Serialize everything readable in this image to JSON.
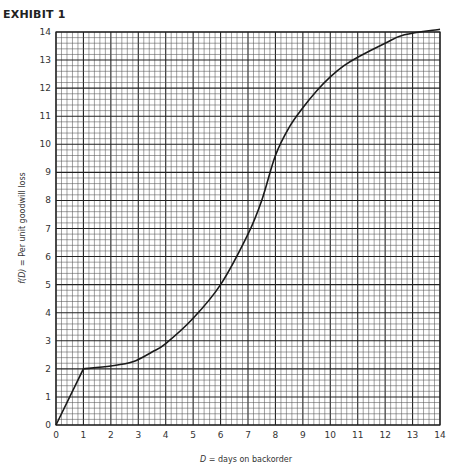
{
  "exhibit_title": "EXHIBIT 1",
  "chart_data": {
    "type": "line",
    "title": "EXHIBIT 1",
    "xlabel": "D = days on backorder",
    "ylabel": "f(D) = Per unit goodwill loss",
    "xlim": [
      0,
      14
    ],
    "ylim": [
      0,
      14
    ],
    "x_ticks": [
      0,
      1,
      2,
      3,
      4,
      5,
      6,
      7,
      8,
      9,
      10,
      11,
      12,
      13,
      14
    ],
    "y_ticks": [
      0,
      1,
      2,
      3,
      4,
      5,
      6,
      7,
      8,
      9,
      10,
      11,
      12,
      13,
      14
    ],
    "grid": true,
    "grid_minor_divisions": 5,
    "legend": null,
    "series": [
      {
        "name": "f(D)",
        "x": [
          0,
          1,
          2,
          2.8,
          3.5,
          4,
          5,
          6,
          7,
          7.5,
          8,
          8.5,
          9,
          9.5,
          10,
          10.5,
          11,
          12,
          12.7,
          14
        ],
        "y": [
          0,
          2,
          2.1,
          2.25,
          2.6,
          2.9,
          3.8,
          5.0,
          6.8,
          8.0,
          9.6,
          10.6,
          11.3,
          11.9,
          12.4,
          12.8,
          13.1,
          13.6,
          13.9,
          14.1
        ]
      }
    ]
  },
  "axes": {
    "x_label_italic": "D",
    "x_label_rest": " = days on backorder",
    "y_label_italic": "f(D)",
    "y_label_rest": " = Per unit goodwill loss"
  }
}
